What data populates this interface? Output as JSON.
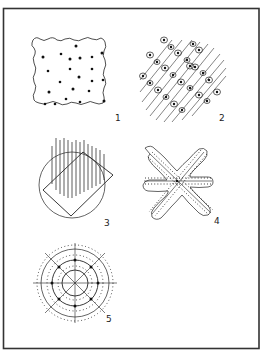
{
  "figure": {
    "frame": {
      "x": 3,
      "y": 8,
      "width": 256,
      "height": 341
    },
    "ink_color": "#222222",
    "panels": [
      {
        "id": 1,
        "label": "1",
        "description": "irregular square with scattered dots"
      },
      {
        "id": 2,
        "label": "2",
        "description": "diagonal lattice lines with beaded loops"
      },
      {
        "id": 3,
        "label": "3",
        "description": "circle with inscribed rotated square and vertical hatching"
      },
      {
        "id": 4,
        "label": "4",
        "description": "six-armed star with dotted arms"
      },
      {
        "id": 5,
        "label": "5",
        "description": "concentric circles with radial lines and dots"
      }
    ]
  }
}
